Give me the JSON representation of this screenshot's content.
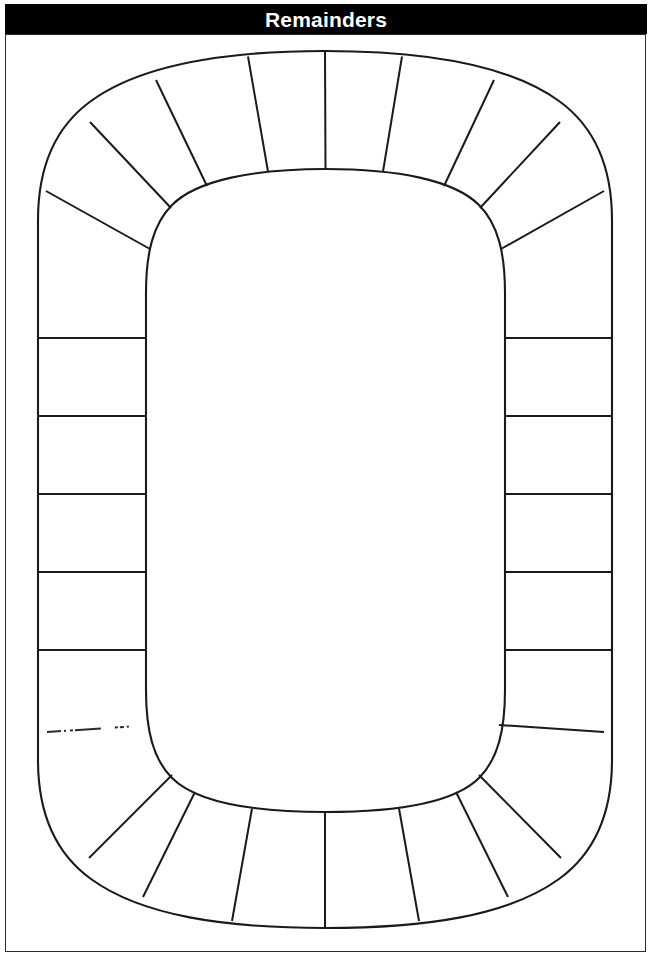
{
  "page": {
    "title": "Remainders",
    "background_color": "#ffffff",
    "ink_color": "#1a1a1a",
    "banner_color": "#000000",
    "banner_text_color": "#ffffff"
  },
  "banner": {
    "label": "Remainders"
  },
  "worksheet": {
    "frame_label": "worksheet-border",
    "board_label": "remainders-game-track"
  },
  "board": {
    "shape": "stadium-ring",
    "description": "Blank rounded-rectangle game track divided into empty cells",
    "total_cells": 24,
    "outer": {
      "left": 38,
      "top": 51,
      "right": 612,
      "bottom": 928,
      "corner_radius": 287
    },
    "inner": {
      "left": 146,
      "top": 169,
      "right": 505,
      "bottom": 812,
      "corner_radius": 180
    },
    "ring_width": 110,
    "straight_divider_y": [
      338,
      416,
      494,
      572,
      650
    ],
    "cells": [
      {
        "id": "cell-1",
        "section": "top-arc",
        "label": ""
      },
      {
        "id": "cell-2",
        "section": "top-arc",
        "label": ""
      },
      {
        "id": "cell-3",
        "section": "top-arc",
        "label": ""
      },
      {
        "id": "cell-4",
        "section": "top-arc",
        "label": ""
      },
      {
        "id": "cell-5",
        "section": "top-arc",
        "label": ""
      },
      {
        "id": "cell-6",
        "section": "top-arc",
        "label": ""
      },
      {
        "id": "cell-7",
        "section": "right-side",
        "label": ""
      },
      {
        "id": "cell-8",
        "section": "right-side",
        "label": ""
      },
      {
        "id": "cell-9",
        "section": "right-side",
        "label": ""
      },
      {
        "id": "cell-10",
        "section": "right-side",
        "label": ""
      },
      {
        "id": "cell-11",
        "section": "right-side",
        "label": ""
      },
      {
        "id": "cell-12",
        "section": "right-side",
        "label": ""
      },
      {
        "id": "cell-13",
        "section": "bottom-arc",
        "label": ""
      },
      {
        "id": "cell-14",
        "section": "bottom-arc",
        "label": ""
      },
      {
        "id": "cell-15",
        "section": "bottom-arc",
        "label": ""
      },
      {
        "id": "cell-16",
        "section": "bottom-arc",
        "label": ""
      },
      {
        "id": "cell-17",
        "section": "bottom-arc",
        "label": ""
      },
      {
        "id": "cell-18",
        "section": "bottom-arc",
        "label": ""
      },
      {
        "id": "cell-19",
        "section": "left-side",
        "label": ""
      },
      {
        "id": "cell-20",
        "section": "left-side",
        "label": ""
      },
      {
        "id": "cell-21",
        "section": "left-side",
        "label": ""
      },
      {
        "id": "cell-22",
        "section": "left-side",
        "label": ""
      },
      {
        "id": "cell-23",
        "section": "left-side",
        "label": ""
      },
      {
        "id": "cell-24",
        "section": "left-side",
        "label": ""
      }
    ]
  }
}
